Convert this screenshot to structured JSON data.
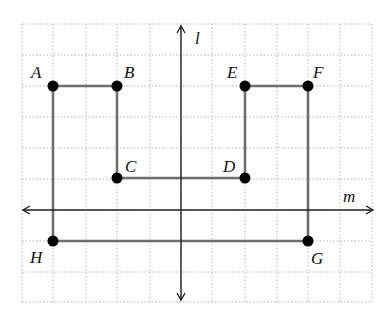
{
  "diagram": {
    "grid": {
      "x_lines": [
        22,
        53,
        86,
        117,
        150,
        181,
        212,
        245,
        277,
        308,
        340,
        372
      ],
      "y_lines": [
        24,
        55,
        86,
        117,
        148,
        179,
        210,
        241,
        272,
        302
      ],
      "color": "#b5b5b5"
    },
    "axes": [
      {
        "name": "l",
        "label": "l",
        "orientation": "vertical",
        "x": 181,
        "y1": 26,
        "y2": 300
      },
      {
        "name": "m",
        "label": "m",
        "orientation": "horizontal",
        "y": 210,
        "x1": 23,
        "x2": 373
      }
    ],
    "points": [
      {
        "label": "A",
        "x": 53,
        "y": 86
      },
      {
        "label": "B",
        "x": 117,
        "y": 86
      },
      {
        "label": "C",
        "x": 117,
        "y": 178
      },
      {
        "label": "D",
        "x": 245,
        "y": 178
      },
      {
        "label": "E",
        "x": 245,
        "y": 86
      },
      {
        "label": "F",
        "x": 308,
        "y": 86
      },
      {
        "label": "G",
        "x": 308,
        "y": 241
      },
      {
        "label": "H",
        "x": 53,
        "y": 241
      }
    ],
    "path_order": [
      "A",
      "B",
      "C",
      "D",
      "E",
      "F",
      "G",
      "H",
      "A"
    ],
    "segment_color": "#6e6e6e",
    "point_color": "#000000"
  }
}
